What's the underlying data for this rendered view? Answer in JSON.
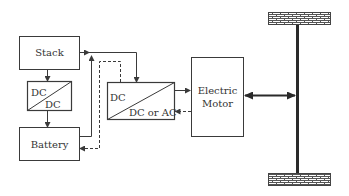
{
  "diagram": {
    "title": "",
    "blocks": {
      "stack": {
        "label": "Stack"
      },
      "dcdc": {
        "top": "DC",
        "bottom": "DC"
      },
      "battery": {
        "label": "Battery"
      },
      "converter": {
        "top": "DC",
        "bottom": "DC or AC"
      },
      "motor": {
        "line1": "Electric",
        "line2": "Motor"
      }
    },
    "wheels": {
      "count": 2,
      "pattern": "brick"
    },
    "colors": {
      "line": "#3a3a3a",
      "fill": "#ffffff",
      "text": "#333333"
    },
    "connections": [
      {
        "from": "stack",
        "to": "dcdc",
        "style": "solid"
      },
      {
        "from": "dcdc",
        "to": "battery",
        "style": "solid"
      },
      {
        "from": "stack",
        "to": "converter",
        "style": "solid"
      },
      {
        "from": "battery",
        "to": "converter",
        "style": "solid"
      },
      {
        "from": "converter",
        "to": "battery",
        "style": "dashed"
      },
      {
        "from": "converter",
        "to": "motor",
        "style": "solid"
      },
      {
        "from": "motor",
        "to": "converter",
        "style": "dashed"
      },
      {
        "from": "motor",
        "to": "axle",
        "style": "bidirectional"
      }
    ]
  }
}
